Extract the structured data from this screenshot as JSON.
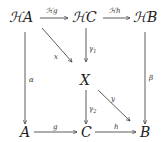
{
  "diagram": {
    "type": "commutative-diagram",
    "nodes": {
      "HA": "ℋA",
      "HC": "ℋC",
      "HB": "ℋB",
      "X": "X",
      "A": "A",
      "C": "C",
      "B": "B"
    },
    "arrows": [
      {
        "from": "HA",
        "to": "HC",
        "label": "ℋg"
      },
      {
        "from": "HC",
        "to": "HB",
        "label": "ℋh"
      },
      {
        "from": "HA",
        "to": "X",
        "label": "x"
      },
      {
        "from": "HC",
        "to": "X",
        "label": "γ1"
      },
      {
        "from": "HA",
        "to": "A",
        "label": "α"
      },
      {
        "from": "HB",
        "to": "B",
        "label": "β"
      },
      {
        "from": "X",
        "to": "C",
        "label": "γ2"
      },
      {
        "from": "X",
        "to": "B",
        "label": "y"
      },
      {
        "from": "A",
        "to": "C",
        "label": "g"
      },
      {
        "from": "C",
        "to": "B",
        "label": "h"
      }
    ],
    "labels": {
      "g_top": "ℋg",
      "h_top": "ℋh",
      "x": "x",
      "gamma1": "γ",
      "gamma1_sub": "1",
      "alpha": "α",
      "beta": "β",
      "gamma2": "γ",
      "gamma2_sub": "2",
      "y": "y",
      "g": "g",
      "h": "h"
    }
  }
}
